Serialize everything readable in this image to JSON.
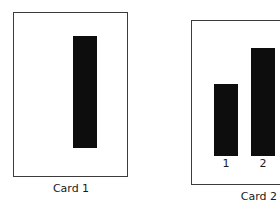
{
  "figure": {
    "background_color": "#ffffff",
    "bar_color": "#0d0d0d",
    "frame_color": "#3c3c3c",
    "text_color": "#1a1a1a"
  },
  "cards": [
    {
      "id": "card-1",
      "caption": "Card 1",
      "bars": [
        {
          "label": "",
          "value": 117
        }
      ],
      "tick_labels": []
    },
    {
      "id": "card-2",
      "caption": "Card 2",
      "bars": [
        {
          "label": "1",
          "value": 75
        },
        {
          "label": "2",
          "value": 113
        }
      ],
      "tick_labels": [
        "1",
        "2"
      ]
    }
  ],
  "chart_data": [
    {
      "type": "bar",
      "title": "Card 1",
      "categories": [
        ""
      ],
      "values": [
        117
      ],
      "xlabel": "",
      "ylabel": "",
      "ylim": [
        0,
        143
      ],
      "grid": false,
      "legend": "none",
      "notes": "Single tall black bar, no tick label beneath it."
    },
    {
      "type": "bar",
      "title": "Card 2",
      "categories": [
        "1",
        "2"
      ],
      "values": [
        75,
        113
      ],
      "xlabel": "",
      "ylabel": "",
      "ylim": [
        0,
        143
      ],
      "grid": false,
      "legend": "none",
      "notes": "Two black bars; bar 2 is taller than bar 1. Tick labels 1 and 2 below bars."
    }
  ]
}
